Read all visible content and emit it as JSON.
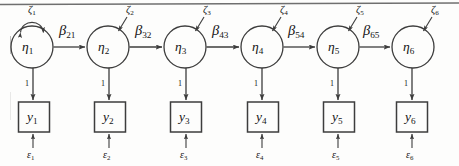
{
  "figure": {
    "type": "path-diagram",
    "top_rule": true,
    "geometry": {
      "width": 459,
      "height": 166,
      "circle_radius": 21,
      "circle_center_y": 47,
      "box_width": 31,
      "box_height": 30,
      "box_top_y": 102,
      "circle_centers_x": [
        32,
        108,
        185,
        262,
        338,
        413
      ],
      "box_centers_x": [
        34,
        110,
        186,
        263,
        339,
        412
      ]
    },
    "colors": {
      "stroke": "#3d3d3d",
      "text": "#141414",
      "background": "#fdfdfc",
      "rule": "#6f6f6f"
    },
    "latent_nodes": [
      {
        "name": "eta-1",
        "label": "η",
        "subscript": "1"
      },
      {
        "name": "eta-2",
        "label": "η",
        "subscript": "2"
      },
      {
        "name": "eta-3",
        "label": "η",
        "subscript": "3"
      },
      {
        "name": "eta-4",
        "label": "η",
        "subscript": "4"
      },
      {
        "name": "eta-5",
        "label": "η",
        "subscript": "5"
      },
      {
        "name": "eta-6",
        "label": "η",
        "subscript": "6"
      }
    ],
    "observed_nodes": [
      {
        "name": "y-1",
        "label": "y",
        "subscript": "1"
      },
      {
        "name": "y-2",
        "label": "y",
        "subscript": "2"
      },
      {
        "name": "y-3",
        "label": "y",
        "subscript": "3"
      },
      {
        "name": "y-4",
        "label": "y",
        "subscript": "4"
      },
      {
        "name": "y-5",
        "label": "y",
        "subscript": "5"
      },
      {
        "name": "y-6",
        "label": "y",
        "subscript": "6"
      }
    ],
    "disturbances": [
      {
        "name": "zeta-1",
        "label": "ζ",
        "subscript": "1",
        "arrow": "curved-double"
      },
      {
        "name": "zeta-2",
        "label": "ζ",
        "subscript": "2",
        "arrow": "straight"
      },
      {
        "name": "zeta-3",
        "label": "ζ",
        "subscript": "3",
        "arrow": "straight"
      },
      {
        "name": "zeta-4",
        "label": "ζ",
        "subscript": "4",
        "arrow": "straight"
      },
      {
        "name": "zeta-5",
        "label": "ζ",
        "subscript": "5",
        "arrow": "straight"
      },
      {
        "name": "zeta-6",
        "label": "ζ",
        "subscript": "6",
        "arrow": "straight"
      }
    ],
    "residuals": [
      {
        "name": "epsilon-1",
        "label": "ε",
        "subscript": "1"
      },
      {
        "name": "epsilon-2",
        "label": "ε",
        "subscript": "2"
      },
      {
        "name": "epsilon-3",
        "label": "ε",
        "subscript": "3"
      },
      {
        "name": "epsilon-4",
        "label": "ε",
        "subscript": "4"
      },
      {
        "name": "epsilon-5",
        "label": "ε",
        "subscript": "5"
      },
      {
        "name": "epsilon-6",
        "label": "ε",
        "subscript": "6"
      }
    ],
    "autoregressive_paths": [
      {
        "name": "beta-21",
        "label": "β",
        "subscript": "21",
        "from": "eta-1",
        "to": "eta-2"
      },
      {
        "name": "beta-32",
        "label": "β",
        "subscript": "32",
        "from": "eta-2",
        "to": "eta-3"
      },
      {
        "name": "beta-43",
        "label": "β",
        "subscript": "43",
        "from": "eta-3",
        "to": "eta-4"
      },
      {
        "name": "beta-54",
        "label": "β",
        "subscript": "54",
        "from": "eta-4",
        "to": "eta-5"
      },
      {
        "name": "beta-65",
        "label": "β",
        "subscript": "65",
        "from": "eta-5",
        "to": "eta-6"
      }
    ],
    "loadings": [
      {
        "name": "loading-1",
        "label": "1"
      },
      {
        "name": "loading-2",
        "label": "1"
      },
      {
        "name": "loading-3",
        "label": "1"
      },
      {
        "name": "loading-4",
        "label": "1"
      },
      {
        "name": "loading-5",
        "label": "1"
      },
      {
        "name": "loading-6",
        "label": "1"
      }
    ]
  }
}
